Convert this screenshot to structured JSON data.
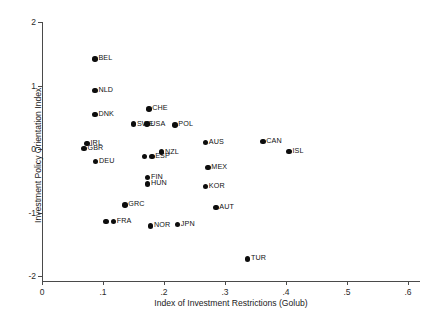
{
  "chart_data": {
    "type": "scatter",
    "title": "",
    "xlabel": "Index of Investment Restrictions (Golub)",
    "ylabel": "Investment Policy Orientation Index",
    "xlim": [
      0,
      0.62
    ],
    "ylim": [
      -2.1,
      2.1
    ],
    "grid": false,
    "legend": "none",
    "marker_color": "#0d0d0d",
    "axis_color": "#4a4a4a",
    "xticks": [
      {
        "value": 0,
        "label": "0"
      },
      {
        "value": 0.1,
        "label": ".1"
      },
      {
        "value": 0.2,
        "label": ".2"
      },
      {
        "value": 0.3,
        "label": ".3"
      },
      {
        "value": 0.4,
        "label": ".4"
      },
      {
        "value": 0.5,
        "label": ".5"
      },
      {
        "value": 0.6,
        "label": ".6"
      }
    ],
    "yticks": [
      {
        "value": 2,
        "label": "2"
      },
      {
        "value": 1,
        "label": "1"
      },
      {
        "value": 0,
        "label": "0"
      },
      {
        "value": -1,
        "label": "-1"
      },
      {
        "value": -2,
        "label": "-2"
      }
    ],
    "points": [
      {
        "label": "BEL",
        "x": 0.087,
        "y": 1.42,
        "label_pos": "right"
      },
      {
        "label": "NLD",
        "x": 0.087,
        "y": 0.92,
        "label_pos": "right"
      },
      {
        "label": "DNK",
        "x": 0.087,
        "y": 0.54,
        "label_pos": "right"
      },
      {
        "label": "CHE",
        "x": 0.175,
        "y": 0.63,
        "label_pos": "right"
      },
      {
        "label": "SWE",
        "x": 0.15,
        "y": 0.39,
        "label_pos": "right"
      },
      {
        "label": "USA",
        "x": 0.172,
        "y": 0.39,
        "label_pos": "right"
      },
      {
        "label": "POL",
        "x": 0.218,
        "y": 0.38,
        "label_pos": "right"
      },
      {
        "label": "IRL",
        "x": 0.074,
        "y": 0.09,
        "label_pos": "right"
      },
      {
        "label": "GBR",
        "x": 0.069,
        "y": 0.01,
        "label_pos": "right"
      },
      {
        "label": "AUS",
        "x": 0.268,
        "y": 0.1,
        "label_pos": "right"
      },
      {
        "label": "CAN",
        "x": 0.362,
        "y": 0.12,
        "label_pos": "right"
      },
      {
        "label": "ISL",
        "x": 0.405,
        "y": -0.04,
        "label_pos": "right"
      },
      {
        "label": "NZL",
        "x": 0.196,
        "y": -0.05,
        "label_pos": "right"
      },
      {
        "label": "ITA",
        "x": 0.168,
        "y": -0.12,
        "label_pos": "hidden"
      },
      {
        "label": "ESP",
        "x": 0.18,
        "y": -0.12,
        "label_pos": "right"
      },
      {
        "label": "DEU",
        "x": 0.088,
        "y": -0.2,
        "label_pos": "right"
      },
      {
        "label": "MEX",
        "x": 0.272,
        "y": -0.29,
        "label_pos": "right"
      },
      {
        "label": "FIN",
        "x": 0.173,
        "y": -0.45,
        "label_pos": "right"
      },
      {
        "label": "HUN",
        "x": 0.173,
        "y": -0.55,
        "label_pos": "right"
      },
      {
        "label": "KOR",
        "x": 0.268,
        "y": -0.59,
        "label_pos": "right"
      },
      {
        "label": "GRC",
        "x": 0.136,
        "y": -0.88,
        "label_pos": "right"
      },
      {
        "label": "AUT",
        "x": 0.285,
        "y": -0.92,
        "label_pos": "right"
      },
      {
        "label": "PRT",
        "x": 0.105,
        "y": -1.14,
        "label_pos": "hidden"
      },
      {
        "label": "FRA",
        "x": 0.117,
        "y": -1.14,
        "label_pos": "right"
      },
      {
        "label": "NOR",
        "x": 0.178,
        "y": -1.21,
        "label_pos": "right"
      },
      {
        "label": "JPN",
        "x": 0.222,
        "y": -1.19,
        "label_pos": "right"
      },
      {
        "label": "TUR",
        "x": 0.337,
        "y": -1.73,
        "label_pos": "right"
      }
    ]
  }
}
